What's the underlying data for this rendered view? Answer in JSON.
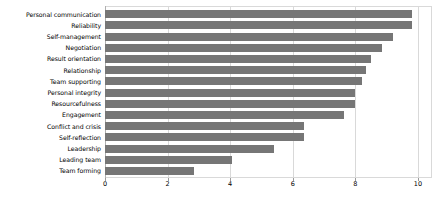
{
  "chart_data": {
    "type": "bar",
    "orientation": "horizontal",
    "title": "",
    "subtitle": "",
    "xlabel": "",
    "ylabel": "",
    "xlim": [
      0,
      10
    ],
    "ylim": null,
    "grid": true,
    "legend": null,
    "legend_position": "none",
    "bar_color": "#767676",
    "gridline_color": "#d9d9d9",
    "axis_color": "#b0b0b0",
    "xticks": [
      0,
      2,
      4,
      6,
      8,
      10
    ],
    "xtick_labels": [
      "0",
      "2",
      "4",
      "6",
      "8",
      "10"
    ],
    "categories": [
      "Personal communication",
      "Reliability",
      "Self-management",
      "Negotiation",
      "Result orientation",
      "Relationship",
      "Team supporting",
      "Personal integrity",
      "Resourcefulness",
      "Engagement",
      "Conflict and crisis",
      "Self-reflection",
      "Leadership",
      "Leading team",
      "Team forming"
    ],
    "values": [
      9.8,
      9.8,
      9.2,
      8.85,
      8.5,
      8.35,
      8.2,
      8.0,
      8.0,
      7.65,
      6.35,
      6.35,
      5.4,
      4.05,
      2.85
    ]
  }
}
